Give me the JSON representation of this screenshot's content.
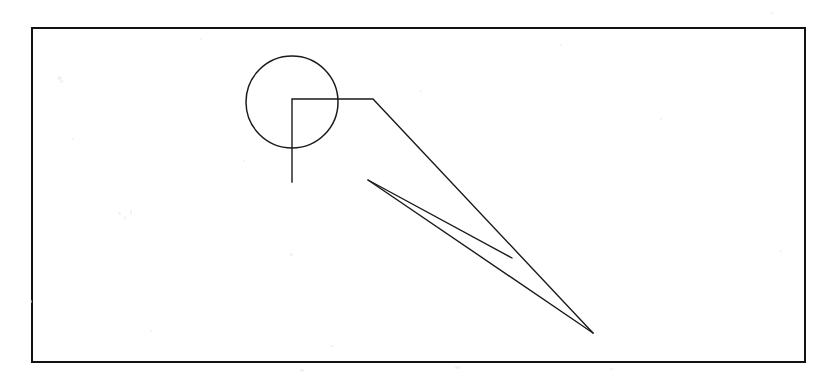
{
  "figure": {
    "canvas": {
      "width": 831,
      "height": 380
    },
    "background_color": "#ffffff",
    "ink_color": "#1a1a1a",
    "frame": {
      "label": "drawing-frame",
      "x": 32,
      "y": 28,
      "width": 773,
      "height": 334,
      "stroke_width": 2.6,
      "stroke_color": "#121212"
    },
    "shapes": [
      {
        "name": "circle",
        "type": "circle",
        "cx": 292,
        "cy": 102,
        "r": 46,
        "stroke_width": 1.5,
        "stroke_color": "#1a1a1a",
        "fill": "none"
      },
      {
        "name": "leader-line",
        "type": "polyline",
        "points": "292,182 292,99 373,99 593,333",
        "stroke_width": 1.4,
        "stroke_color": "#1a1a1a",
        "fill": "none"
      },
      {
        "name": "wedge-upper-edge",
        "type": "line",
        "x1": 368,
        "y1": 180,
        "x2": 512,
        "y2": 258,
        "stroke_width": 1.4,
        "stroke_color": "#1a1a1a"
      },
      {
        "name": "wedge-lower-edge",
        "type": "line",
        "x1": 368,
        "y1": 180,
        "x2": 593,
        "y2": 333,
        "stroke_width": 1.4,
        "stroke_color": "#1a1a1a"
      }
    ],
    "annotations": {
      "circle_center_marker": "292,102",
      "leader_corner": "292,99",
      "leader_elbow": "373,99",
      "wedge_apex": "368,180",
      "convergence_point": "593,333",
      "crossing_point": "512,258"
    },
    "specks": [
      {
        "x": 118,
        "y": 212,
        "w": 3,
        "h": 3
      },
      {
        "x": 124,
        "y": 216,
        "w": 2,
        "h": 4
      },
      {
        "x": 130,
        "y": 210,
        "w": 2,
        "h": 5
      },
      {
        "x": 57,
        "y": 76,
        "w": 5,
        "h": 4
      },
      {
        "x": 60,
        "y": 80,
        "w": 3,
        "h": 3
      },
      {
        "x": 200,
        "y": 38,
        "w": 2,
        "h": 2
      },
      {
        "x": 560,
        "y": 44,
        "w": 2,
        "h": 2
      },
      {
        "x": 72,
        "y": 138,
        "w": 2,
        "h": 2
      },
      {
        "x": 243,
        "y": 160,
        "w": 2,
        "h": 2
      },
      {
        "x": 290,
        "y": 253,
        "w": 3,
        "h": 3
      },
      {
        "x": 330,
        "y": 345,
        "w": 4,
        "h": 2
      },
      {
        "x": 455,
        "y": 366,
        "w": 5,
        "h": 3
      },
      {
        "x": 300,
        "y": 369,
        "w": 4,
        "h": 3
      },
      {
        "x": 610,
        "y": 368,
        "w": 3,
        "h": 2
      },
      {
        "x": 770,
        "y": 12,
        "w": 3,
        "h": 2
      },
      {
        "x": 30,
        "y": 300,
        "w": 2,
        "h": 3
      },
      {
        "x": 660,
        "y": 118,
        "w": 2,
        "h": 2
      },
      {
        "x": 420,
        "y": 90,
        "w": 2,
        "h": 2
      },
      {
        "x": 780,
        "y": 250,
        "w": 2,
        "h": 2
      },
      {
        "x": 150,
        "y": 330,
        "w": 2,
        "h": 2
      }
    ]
  }
}
